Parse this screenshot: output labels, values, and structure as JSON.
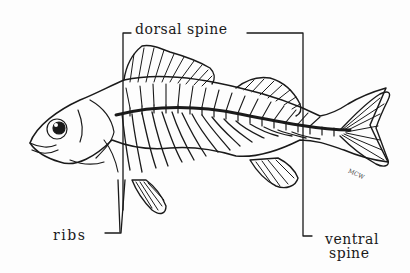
{
  "diagram": {
    "labels": {
      "dorsal_spine": "dorsal spine",
      "ribs": "ribs",
      "ventral_spine_line1": "ventral",
      "ventral_spine_line2": "spine"
    },
    "signature": "MCW",
    "colors": {
      "ink": "#1a1a1a",
      "background": "#fdfdfd"
    }
  }
}
